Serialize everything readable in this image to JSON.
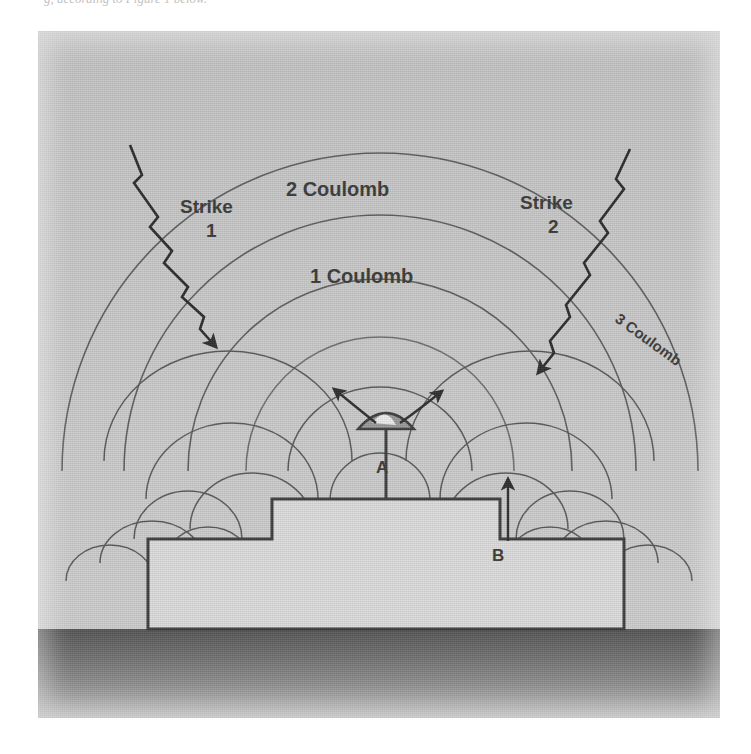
{
  "page": {
    "clipped_caption": "g, according to Figure 1 below.",
    "background_color": "#ffffff"
  },
  "figure": {
    "panel_color": "#c8c8c8",
    "ground_color": "#6e6e6e",
    "ink_color": "#3a3a3a",
    "structure_fill": "#d8d8d8",
    "labels": {
      "strike_1_line1": "Strike",
      "strike_1_line2": "1",
      "strike_2_line1": "Strike",
      "strike_2_line2": "2",
      "coulomb_1": "1 Coulomb",
      "coulomb_2": "2 Coulomb",
      "coulomb_3": "3 Coulomb",
      "point_a": "A",
      "point_b": "B"
    },
    "elements": [
      {
        "name": "equipotential-ring-1-coulomb",
        "value": "1 Coulomb"
      },
      {
        "name": "equipotential-ring-2-coulomb",
        "value": "2 Coulomb"
      },
      {
        "name": "equipotential-ring-3-coulomb",
        "value": "3 Coulomb"
      },
      {
        "name": "lightning-strike-1",
        "value": "Strike 1"
      },
      {
        "name": "lightning-strike-2",
        "value": "Strike 2"
      },
      {
        "name": "measurement-point-a",
        "value": "A"
      },
      {
        "name": "measurement-point-b",
        "value": "B"
      }
    ]
  }
}
